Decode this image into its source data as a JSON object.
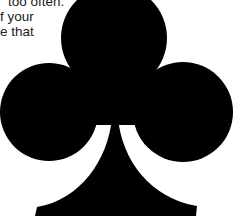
{
  "text": {
    "lines": [
      "too often.",
      "f your",
      "e that"
    ]
  },
  "graphic": {
    "icon": "club-suit-icon",
    "fill_color": "#000000",
    "background_color": "#ffffff"
  }
}
